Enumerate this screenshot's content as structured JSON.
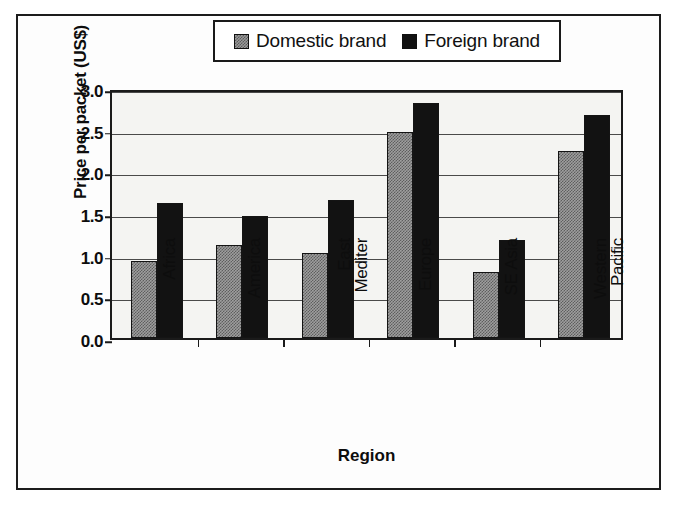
{
  "legend": {
    "entries": [
      {
        "label": "Domestic brand",
        "swatch": "domestic-swatch"
      },
      {
        "label": "Foreign brand",
        "swatch": "foreign-swatch"
      }
    ]
  },
  "axes": {
    "y_title": "Price per packet (US$)",
    "x_title": "Region",
    "y_ticks": [
      "3.0",
      "2.5",
      "2.0",
      "1.5",
      "1.0",
      "0.5",
      "0.0"
    ]
  },
  "chart_data": {
    "type": "bar",
    "title": "",
    "xlabel": "Region",
    "ylabel": "Price per packet (US$)",
    "ylim": [
      0.0,
      3.0
    ],
    "ytick_values": [
      0.0,
      0.5,
      1.0,
      1.5,
      2.0,
      2.5,
      3.0
    ],
    "ytick_labels": [
      "0.0",
      "0.5",
      "1.0",
      "1.5",
      "2.0",
      "2.5",
      "3.0"
    ],
    "grid": true,
    "legend_position": "top-center",
    "categories": [
      "Africa",
      "America",
      "East\nMediter",
      "Europe",
      "SE Asia",
      "Western\nPacific"
    ],
    "category_labels_rotated": true,
    "series": [
      {
        "name": "Domestic brand",
        "color": "#9e9e9e",
        "pattern": "checkered",
        "values": [
          0.93,
          1.12,
          1.02,
          2.47,
          0.79,
          2.25
        ]
      },
      {
        "name": "Foreign brand",
        "color": "#121212",
        "pattern": "solid",
        "values": [
          1.62,
          1.47,
          1.66,
          2.82,
          1.18,
          2.68
        ]
      }
    ]
  }
}
